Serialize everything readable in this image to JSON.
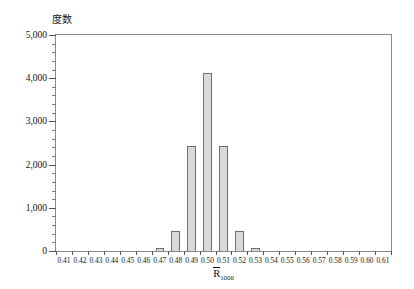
{
  "chart_data": {
    "type": "bar",
    "title": "",
    "ylabel": "度数",
    "xlabel_main": "R",
    "xlabel_sub": "1000",
    "xlabel_text": "R̀1000",
    "categories": [
      "0.41",
      "0.42",
      "0.43",
      "0.44",
      "0.45",
      "0.46",
      "0.47",
      "0.48",
      "0.49",
      "0.50",
      "0.51",
      "0.52",
      "0.53",
      "0.54",
      "0.55",
      "0.56",
      "0.57",
      "0.58",
      "0.59",
      "0.60",
      "0.61"
    ],
    "values": [
      0,
      0,
      0,
      0,
      0,
      0,
      60,
      460,
      2430,
      4120,
      2430,
      460,
      60,
      0,
      0,
      0,
      0,
      0,
      0,
      0,
      0
    ],
    "ylim": [
      0,
      5000
    ],
    "ytick_labels": [
      "0",
      "1,000",
      "2,000",
      "3,000",
      "4,000",
      "5,000"
    ],
    "ytick_values": [
      0,
      1000,
      2000,
      3000,
      4000,
      5000
    ],
    "yminor_step": 200,
    "xlim": [
      0.405,
      0.615
    ],
    "grid": false,
    "legend": false,
    "bar_fill_color": "#d9d9d9",
    "bar_edge_color": "#6f6f6f",
    "frame_color": "#8a8a8a"
  }
}
